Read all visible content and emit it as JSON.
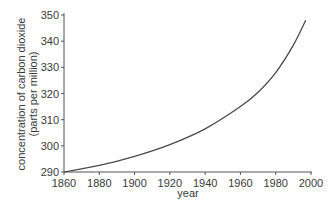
{
  "chart_data": {
    "type": "line",
    "title": "",
    "xlabel": "year",
    "ylabel": "concentration of carbon dioxide (parts per million)",
    "ylabel_lines": [
      "concentration of carbon dioxide",
      "(parts per million)"
    ],
    "xlim": [
      1860,
      2000
    ],
    "ylim": [
      290,
      350
    ],
    "x_ticks": [
      1860,
      1880,
      1900,
      1920,
      1940,
      1960,
      1980,
      2000
    ],
    "y_ticks": [
      290,
      300,
      310,
      320,
      330,
      340,
      350
    ],
    "grid": false,
    "legend": null,
    "series": [
      {
        "name": "CO2 concentration",
        "color": "#4a4a4a",
        "x": [
          1860,
          1880,
          1900,
          1920,
          1940,
          1960,
          1970,
          1980,
          1990,
          1997
        ],
        "values": [
          290,
          292.5,
          296,
          300.5,
          306.5,
          315,
          320.5,
          328,
          338.5,
          348
        ]
      }
    ]
  },
  "colors": {
    "axis": "#555555",
    "line": "#4a4a4a",
    "text": "#3a3a3a",
    "background": "#ffffff"
  }
}
